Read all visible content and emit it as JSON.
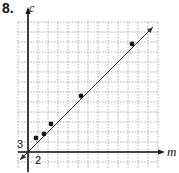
{
  "problem_number": "8.",
  "chart_data": {
    "type": "scatter",
    "title": "",
    "xlabel": "m",
    "ylabel": "c",
    "x_tick_label": "2",
    "y_tick_label": "3",
    "x_scale_per_cell": 2,
    "y_scale_per_cell": 3,
    "grid": true,
    "points": [
      {
        "m": 1.6,
        "c": 4.2
      },
      {
        "m": 3.2,
        "c": 5.4
      },
      {
        "m": 4.6,
        "c": 8.4
      },
      {
        "m": 10.6,
        "c": 16.8
      },
      {
        "m": 20.8,
        "c": 32.4
      }
    ],
    "trend_line": {
      "type": "line",
      "from": {
        "m": -1.6,
        "c": -2.4
      },
      "to": {
        "m": 25,
        "c": 37.5
      },
      "arrows": "both"
    },
    "xlim": [
      0,
      25
    ],
    "ylim": [
      0,
      39
    ]
  },
  "colors": {
    "grid": "#9a9a9a",
    "axis": "#111111",
    "point": "#111111",
    "line": "#333333"
  }
}
